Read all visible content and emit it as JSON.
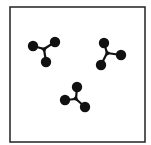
{
  "figure": {
    "frame": {
      "x": 10,
      "y": 7,
      "width": 135,
      "height": 135,
      "stroke": "#222222",
      "stroke_width": 1.5
    },
    "color": "#111111",
    "molecules": [
      {
        "name": "molecule-1",
        "center": [
          44,
          49
        ],
        "atoms": [
          [
            33,
            46
          ],
          [
            55,
            42
          ],
          [
            46,
            62
          ]
        ],
        "atom_radius": 5.2
      },
      {
        "name": "molecule-2",
        "center": [
          107,
          53
        ],
        "atoms": [
          [
            104,
            43
          ],
          [
            121,
            55
          ],
          [
            101,
            65
          ]
        ],
        "atom_radius": 5.2
      },
      {
        "name": "molecule-3",
        "center": [
          76,
          99
        ],
        "atoms": [
          [
            77,
            87
          ],
          [
            65,
            100
          ],
          [
            85,
            107
          ]
        ],
        "atom_radius": 5.2
      }
    ]
  }
}
